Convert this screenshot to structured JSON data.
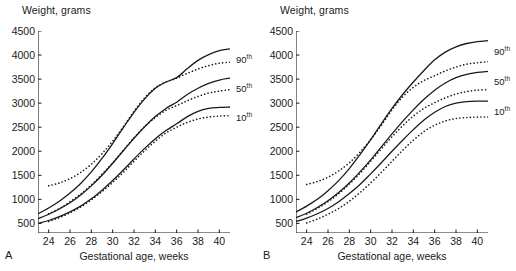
{
  "figure": {
    "panels": [
      {
        "letter": "A",
        "ylabel": "Weight, grams",
        "xlabel": "Gestational age, weeks",
        "curve_labels": [
          {
            "num": "90",
            "sup": "th"
          },
          {
            "num": "50",
            "sup": "th"
          },
          {
            "num": "10",
            "sup": "th"
          }
        ]
      },
      {
        "letter": "B",
        "ylabel": "Weight, grams",
        "xlabel": "Gestational age, weeks",
        "curve_labels": [
          {
            "num": "90",
            "sup": "th"
          },
          {
            "num": "50",
            "sup": "th"
          },
          {
            "num": "10",
            "sup": "th"
          }
        ]
      }
    ]
  },
  "chart_data": [
    {
      "panel": "A",
      "type": "line",
      "title": "",
      "xlabel": "Gestational age, weeks",
      "ylabel": "Weight, grams",
      "xlim": [
        23,
        41
      ],
      "ylim": [
        300,
        4500
      ],
      "xticks": [
        24,
        26,
        28,
        30,
        32,
        34,
        36,
        38,
        40
      ],
      "yticks": [
        500,
        1000,
        1500,
        2000,
        2500,
        3000,
        3500,
        4000,
        4500
      ],
      "grid": false,
      "legend_position": "right-of-curve-ends",
      "x": [
        23,
        24,
        25,
        26,
        27,
        28,
        29,
        30,
        31,
        32,
        33,
        34,
        35,
        36,
        37,
        38,
        39,
        40,
        41
      ],
      "series": [
        {
          "name": "90th percentile (solid)",
          "style": "solid",
          "label": "90th",
          "values": [
            700,
            820,
            960,
            1130,
            1330,
            1570,
            1850,
            2160,
            2490,
            2810,
            3090,
            3310,
            3440,
            3530,
            3720,
            3890,
            4010,
            4090,
            4130
          ]
        },
        {
          "name": "90th percentile (dotted)",
          "style": "dotted",
          "label": "90th",
          "values": [
            1250,
            1280,
            1340,
            1430,
            1560,
            1730,
            1950,
            2210,
            2510,
            2830,
            3110,
            3320,
            3440,
            3520,
            3620,
            3710,
            3780,
            3830,
            3850
          ]
        },
        {
          "name": "50th percentile (solid)",
          "style": "solid",
          "label": "50th",
          "values": [
            600,
            690,
            800,
            930,
            1090,
            1280,
            1500,
            1750,
            2010,
            2270,
            2510,
            2720,
            2890,
            3020,
            3180,
            3310,
            3410,
            3480,
            3520
          ]
        },
        {
          "name": "50th percentile (dotted)",
          "style": "dotted",
          "label": "50th",
          "values": [
            610,
            700,
            810,
            950,
            1110,
            1300,
            1520,
            1760,
            2020,
            2280,
            2510,
            2700,
            2850,
            2950,
            3050,
            3140,
            3210,
            3250,
            3280
          ]
        },
        {
          "name": "10th percentile (solid)",
          "style": "solid",
          "label": "10th",
          "values": [
            500,
            560,
            640,
            740,
            860,
            1010,
            1190,
            1390,
            1610,
            1840,
            2060,
            2260,
            2430,
            2570,
            2720,
            2830,
            2890,
            2910,
            2920
          ]
        },
        {
          "name": "10th percentile (dotted)",
          "style": "dotted",
          "label": "10th",
          "values": [
            480,
            540,
            620,
            720,
            840,
            990,
            1160,
            1350,
            1560,
            1790,
            2010,
            2210,
            2380,
            2500,
            2600,
            2670,
            2710,
            2730,
            2740
          ]
        }
      ]
    },
    {
      "panel": "B",
      "type": "line",
      "title": "",
      "xlabel": "Gestational age, weeks",
      "ylabel": "Weight, grams",
      "xlim": [
        23,
        41
      ],
      "ylim": [
        300,
        4500
      ],
      "xticks": [
        24,
        26,
        28,
        30,
        32,
        34,
        36,
        38,
        40
      ],
      "yticks": [
        500,
        1000,
        1500,
        2000,
        2500,
        3000,
        3500,
        4000,
        4500
      ],
      "grid": false,
      "legend_position": "right-of-curve-ends",
      "x": [
        23,
        24,
        25,
        26,
        27,
        28,
        29,
        30,
        31,
        32,
        33,
        34,
        35,
        36,
        37,
        38,
        39,
        40,
        41
      ],
      "series": [
        {
          "name": "90th percentile (solid)",
          "style": "solid",
          "label": "90th",
          "values": [
            740,
            860,
            1000,
            1180,
            1390,
            1640,
            1930,
            2240,
            2570,
            2890,
            3180,
            3440,
            3680,
            3900,
            4060,
            4170,
            4240,
            4280,
            4300
          ]
        },
        {
          "name": "90th percentile (dotted)",
          "style": "dotted",
          "label": "90th",
          "values": [
            1280,
            1310,
            1370,
            1460,
            1590,
            1760,
            1980,
            2240,
            2540,
            2860,
            3130,
            3330,
            3470,
            3570,
            3670,
            3750,
            3810,
            3840,
            3860
          ]
        },
        {
          "name": "50th percentile (solid)",
          "style": "solid",
          "label": "50th",
          "values": [
            620,
            710,
            830,
            970,
            1140,
            1340,
            1570,
            1820,
            2090,
            2360,
            2620,
            2860,
            3080,
            3270,
            3420,
            3530,
            3600,
            3640,
            3660
          ]
        },
        {
          "name": "50th percentile (dotted)",
          "style": "dotted",
          "label": "50th",
          "values": [
            600,
            690,
            810,
            950,
            1120,
            1320,
            1540,
            1790,
            2050,
            2300,
            2530,
            2730,
            2890,
            3010,
            3110,
            3190,
            3240,
            3270,
            3280
          ]
        },
        {
          "name": "10th percentile (solid)",
          "style": "solid",
          "label": "10th",
          "values": [
            540,
            610,
            700,
            810,
            950,
            1120,
            1310,
            1530,
            1760,
            2000,
            2230,
            2450,
            2650,
            2810,
            2930,
            3000,
            3030,
            3040,
            3040
          ]
        },
        {
          "name": "10th percentile (dotted)",
          "style": "dotted",
          "label": "10th",
          "values": [
            450,
            510,
            590,
            690,
            810,
            960,
            1140,
            1340,
            1560,
            1790,
            2020,
            2230,
            2410,
            2540,
            2630,
            2680,
            2700,
            2710,
            2710
          ]
        }
      ]
    }
  ]
}
